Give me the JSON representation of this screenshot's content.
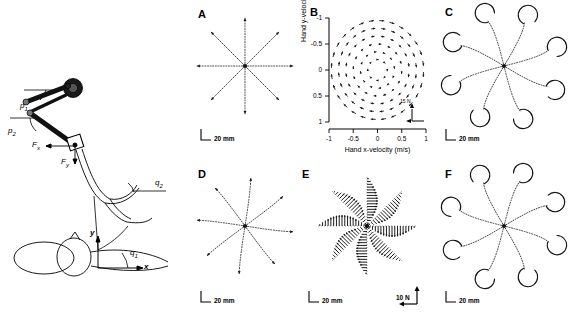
{
  "figure": {
    "panels": [
      {
        "id": "schematic",
        "label": "",
        "x": 0,
        "y": 0,
        "w": 190,
        "h": 322
      },
      {
        "id": "A",
        "label": "A",
        "x": 190,
        "y": 0,
        "w": 110,
        "h": 160
      },
      {
        "id": "B",
        "label": "B",
        "x": 300,
        "y": 0,
        "w": 135,
        "h": 160
      },
      {
        "id": "C",
        "label": "C",
        "x": 435,
        "y": 0,
        "w": 137,
        "h": 160
      },
      {
        "id": "D",
        "label": "D",
        "x": 190,
        "y": 160,
        "w": 110,
        "h": 162
      },
      {
        "id": "E",
        "label": "E",
        "x": 300,
        "y": 160,
        "w": 135,
        "h": 162
      },
      {
        "id": "F",
        "label": "F",
        "x": 435,
        "y": 160,
        "w": 137,
        "h": 162
      }
    ]
  },
  "schematic": {
    "labels": {
      "p1": "p",
      "p1_sub": "1",
      "p2": "p",
      "p2_sub": "2",
      "fx": "F",
      "fx_sub": "x",
      "fy": "F",
      "fy_sub": "y",
      "q1": "q",
      "q1_sub": "1",
      "q2": "q",
      "q2_sub": "2",
      "axis_x": "x",
      "axis_y": "y"
    }
  },
  "panelA": {
    "label": "A",
    "scalebar": "20 mm",
    "caption_type": "null-field reaching trajectories"
  },
  "panelB": {
    "label": "B",
    "xlabel": "Hand x-velocity (m/s)",
    "ylabel": "Hand y-velocity (m/s)",
    "xticks": [
      "-1",
      "-0.5",
      "0",
      "0.5",
      "1"
    ],
    "yticks": [
      "1",
      "0.5",
      "0",
      "-0.5",
      "-1"
    ],
    "force_scale": "15 N"
  },
  "panelC": {
    "label": "C",
    "scalebar": "20 mm"
  },
  "panelD": {
    "label": "D",
    "scalebar": "20 mm"
  },
  "panelE": {
    "label": "E",
    "scalebar": "20 mm",
    "force_scale": "10 N"
  },
  "panelF": {
    "label": "F",
    "scalebar": "20 mm"
  },
  "chart_data": {
    "type": "scatter",
    "title": "",
    "panels": [
      {
        "id": "A",
        "type": "trajectory",
        "title": "A",
        "description": "Eight radial hand-path trajectories from a center start point, straight dotted paths with arrowheads at endpoints",
        "n_directions": 8,
        "directions_deg": [
          0,
          45,
          90,
          135,
          180,
          225,
          270,
          315
        ],
        "radius_mm": 50,
        "curvature": 0.0,
        "scalebar_mm": 20,
        "xlabel": "",
        "ylabel": ""
      },
      {
        "id": "B",
        "type": "quiver",
        "title": "B",
        "description": "Curl force field in hand velocity space; force vectors tangential/clockwise to velocity",
        "xlabel": "Hand x-velocity (m/s)",
        "ylabel": "Hand y-velocity (m/s)",
        "xlim": [
          -1,
          1
        ],
        "ylim": [
          -1,
          1
        ],
        "xticks": [
          -1,
          -0.5,
          0,
          0.5,
          1
        ],
        "yticks": [
          -1,
          -0.5,
          0,
          0.5,
          1
        ],
        "grid": false,
        "force_scale_N": 15,
        "field_matrix": [
          [
            0,
            15
          ],
          [
            -15,
            0
          ]
        ],
        "sample_radii": [
          0.2,
          0.35,
          0.5,
          0.65,
          0.8,
          0.95
        ],
        "vectors_per_ring": [
          8,
          12,
          16,
          20,
          24,
          28
        ]
      },
      {
        "id": "C",
        "type": "trajectory",
        "title": "C",
        "description": "Initial exposure to curl field: strongly hooked, curved trajectories deviating counterclockwise",
        "n_directions": 8,
        "directions_deg": [
          0,
          45,
          90,
          135,
          180,
          225,
          270,
          315
        ],
        "radius_mm": 50,
        "curvature": 0.85,
        "scalebar_mm": 20
      },
      {
        "id": "D",
        "type": "trajectory",
        "title": "D",
        "description": "After adaptation: near-straight trajectories with slight residual curvature",
        "n_directions": 8,
        "directions_deg": [
          0,
          45,
          90,
          135,
          180,
          225,
          270,
          315
        ],
        "radius_mm": 50,
        "curvature": 0.22,
        "scalebar_mm": 20
      },
      {
        "id": "E",
        "type": "quiver",
        "title": "E",
        "description": "Forces produced by subject along each of eight movement directions; vectors perpendicular to path",
        "n_directions": 8,
        "directions_deg": [
          0,
          45,
          90,
          135,
          180,
          225,
          270,
          315
        ],
        "scalebar_mm": 20,
        "force_scale_N": 10,
        "samples_per_direction": 18,
        "peak_force_N": 10
      },
      {
        "id": "F",
        "type": "trajectory",
        "title": "F",
        "description": "After-effect trajectories on field removal: hooked in opposite direction to panel C",
        "n_directions": 8,
        "directions_deg": [
          0,
          45,
          90,
          135,
          180,
          225,
          270,
          315
        ],
        "radius_mm": 50,
        "curvature": -0.85,
        "scalebar_mm": 20
      }
    ]
  }
}
